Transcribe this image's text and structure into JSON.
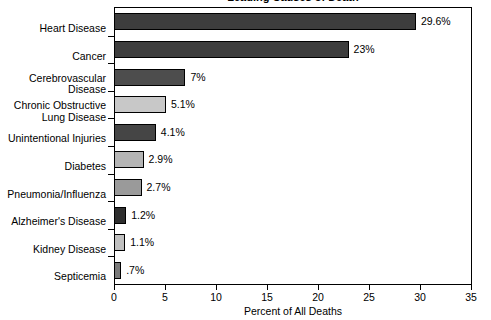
{
  "chart_data": {
    "type": "bar",
    "orientation": "horizontal",
    "title": "Leading Causes of Death",
    "xlabel": "Percent of All Deaths",
    "ylabel": "",
    "xlim": [
      0,
      35
    ],
    "xticks": [
      0,
      5,
      10,
      15,
      20,
      25,
      30,
      35
    ],
    "xtick_labels": [
      "0",
      "5",
      "10",
      "15",
      "20",
      "25",
      "30",
      "35"
    ],
    "grid": false,
    "legend": null,
    "categories": [
      "Heart Disease",
      "Cancer",
      "Cerebrovascular\nDisease",
      "Chronic Obstructive\nLung Disease",
      "Unintentional Injuries",
      "Diabetes",
      "Pneumonia/Influenza",
      "Alzheimer's Disease",
      "Kidney Disease",
      "Septicemia"
    ],
    "values": [
      29.6,
      23,
      7,
      5.1,
      4.1,
      2.9,
      2.7,
      1.2,
      1.1,
      0.7
    ],
    "data_labels": [
      "29.6%",
      "23%",
      "7%",
      "5.1%",
      "4.1%",
      "2.9%",
      "2.7%",
      "1.2%",
      "1.1%",
      ".7%"
    ],
    "bar_colors": [
      "#3d3d3d",
      "#3d3d3d",
      "#4d4d4d",
      "#c8c8c8",
      "#454545",
      "#b4b4b4",
      "#9a9a9a",
      "#2e2e2e",
      "#c0c0c0",
      "#7a7a7a"
    ]
  },
  "axis": {
    "x_title": "Percent of All Deaths"
  }
}
